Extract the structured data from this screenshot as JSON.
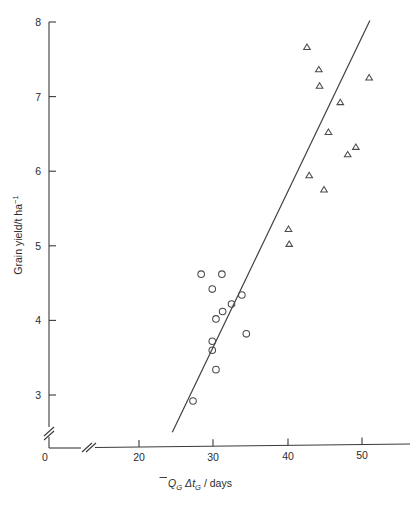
{
  "chart_data": {
    "type": "scatter",
    "title": "",
    "xlabel": "Q̄G ΔtG / days",
    "ylabel": "Grain yield/t ha⁻¹",
    "xlim": [
      0,
      55
    ],
    "ylim": [
      0,
      8
    ],
    "x_axis_break": true,
    "y_axis_break": true,
    "x_break_after": 0,
    "y_break_between": [
      0,
      3
    ],
    "grid": false,
    "legend": "none",
    "xticks": [
      0,
      20,
      30,
      40,
      50
    ],
    "yticks": [
      0,
      3,
      4,
      5,
      6,
      7,
      8
    ],
    "series": [
      {
        "name": "circles",
        "marker": "circle",
        "points": [
          {
            "x": 28.4,
            "y": 4.62
          },
          {
            "x": 31.2,
            "y": 4.62
          },
          {
            "x": 29.9,
            "y": 4.42
          },
          {
            "x": 32.5,
            "y": 4.22
          },
          {
            "x": 33.9,
            "y": 4.34
          },
          {
            "x": 31.3,
            "y": 4.12
          },
          {
            "x": 30.4,
            "y": 4.02
          },
          {
            "x": 34.5,
            "y": 3.82
          },
          {
            "x": 29.9,
            "y": 3.72
          },
          {
            "x": 29.9,
            "y": 3.6
          },
          {
            "x": 30.4,
            "y": 3.34
          },
          {
            "x": 27.3,
            "y": 2.92
          }
        ]
      },
      {
        "name": "triangles",
        "marker": "triangle",
        "points": [
          {
            "x": 42.7,
            "y": 7.66
          },
          {
            "x": 44.3,
            "y": 7.36
          },
          {
            "x": 51.1,
            "y": 7.25
          },
          {
            "x": 44.4,
            "y": 7.14
          },
          {
            "x": 47.2,
            "y": 6.92
          },
          {
            "x": 45.6,
            "y": 6.52
          },
          {
            "x": 49.3,
            "y": 6.32
          },
          {
            "x": 48.2,
            "y": 6.22
          },
          {
            "x": 43.0,
            "y": 5.94
          },
          {
            "x": 45.0,
            "y": 5.75
          },
          {
            "x": 40.2,
            "y": 5.22
          },
          {
            "x": 40.3,
            "y": 5.02
          }
        ]
      }
    ],
    "fit_line": {
      "name": "regression-line",
      "x1": 24.5,
      "y1": 2.5,
      "x2": 51.2,
      "y2": 8.02
    }
  },
  "labels": {
    "y_tick_8": "8",
    "y_tick_7": "7",
    "y_tick_6": "6",
    "y_tick_5": "5",
    "y_tick_4": "4",
    "y_tick_3": "3",
    "y_tick_0": "0",
    "x_tick_20": "20",
    "x_tick_30": "30",
    "x_tick_40": "40",
    "x_tick_50": "50",
    "y_axis_title": "Grain yield/t ha⁻¹",
    "x_axis_title_q": "Q",
    "x_axis_title_q_sub": "G",
    "x_axis_title_delta_t": "Δt",
    "x_axis_title_t_sub": "G",
    "x_axis_title_tail": "/ days"
  },
  "colors": {
    "background": "#ffffff",
    "axis": "#3a3a3a",
    "marker": "#4a4a4a",
    "fit_line": "#404040",
    "text": "#2b2b2b"
  }
}
